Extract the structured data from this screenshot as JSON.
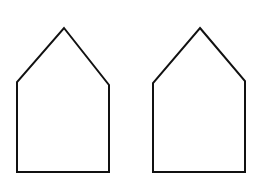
{
  "figure": {
    "width": 264,
    "height": 182,
    "background": "#ffffff",
    "stroke_color": "#111111",
    "stroke_width": 2,
    "shapes": [
      {
        "name": "pentagon-left",
        "type": "pentagon",
        "points": [
          [
            64,
            28
          ],
          [
            109,
            85
          ],
          [
            109,
            172
          ],
          [
            17,
            172
          ],
          [
            17,
            82
          ]
        ]
      },
      {
        "name": "pentagon-right",
        "type": "pentagon",
        "points": [
          [
            200,
            28
          ],
          [
            245,
            81
          ],
          [
            245,
            172
          ],
          [
            153,
            172
          ],
          [
            153,
            83
          ]
        ]
      }
    ]
  }
}
